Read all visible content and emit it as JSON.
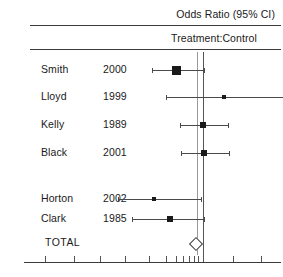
{
  "header": {
    "title": "Odds Ratio (95% CI)",
    "subtitle": "Treatment:Control"
  },
  "columns": {
    "study": "Study",
    "year": "Year"
  },
  "total_label": "TOTAL",
  "chart_data": {
    "type": "forest",
    "title": "Odds Ratio (95% CI)",
    "subtitle": "Treatment:Control",
    "xlabel": "",
    "ylabel": "",
    "scale": "log",
    "null_line": 1,
    "reference_lines": [
      0.88,
      1.0
    ],
    "xlim": [
      0.05,
      12
    ],
    "grid": false,
    "legend": "none",
    "studies": [
      {
        "name": "Smith",
        "year": "2000",
        "estimate": 0.62,
        "ci_low": 0.4,
        "ci_high": 1.02,
        "marker": "square",
        "weight": "large"
      },
      {
        "name": "Lloyd",
        "year": "1999",
        "estimate": 1.45,
        "ci_low": 0.52,
        "ci_high": 4.3,
        "marker": "square",
        "weight": "small"
      },
      {
        "name": "Kelly",
        "year": "1989",
        "estimate": 1.0,
        "ci_low": 0.66,
        "ci_high": 1.55,
        "marker": "square",
        "weight": "medium"
      },
      {
        "name": "Black",
        "year": "2001",
        "estimate": 1.02,
        "ci_low": 0.68,
        "ci_high": 1.58,
        "marker": "square",
        "weight": "medium"
      },
      {
        "name": "Horton",
        "year": "2002",
        "estimate": 0.42,
        "ci_low": 0.22,
        "ci_high": 0.96,
        "marker": "square",
        "weight": "small"
      },
      {
        "name": "Clark",
        "year": "1985",
        "estimate": 0.55,
        "ci_low": 0.28,
        "ci_high": 1.02,
        "marker": "square",
        "weight": "medium"
      }
    ],
    "summary": {
      "name": "TOTAL",
      "year": "",
      "estimate": 0.86,
      "ci_low": 0.72,
      "ci_high": 1.03,
      "marker": "diamond"
    },
    "axis_ticks": [
      0.06,
      0.1,
      0.16,
      0.25,
      0.38,
      0.52,
      0.62,
      0.7,
      0.78,
      0.85,
      0.92,
      1.0,
      1.7,
      2.8,
      4.2,
      8.5
    ]
  }
}
